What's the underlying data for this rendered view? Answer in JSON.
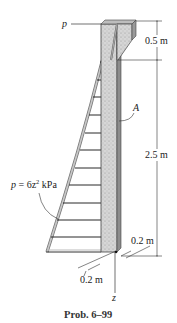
{
  "figure": {
    "caption": "Prob. 6–99",
    "labels": {
      "pressure_symbol": "p",
      "point_a": "A",
      "z_axis": "z",
      "load_equation_p": "p",
      "load_equation_eq": " = 6z",
      "load_equation_exp": "2",
      "load_equation_unit": " kPa"
    },
    "dimensions": {
      "top_height": "0.5 m",
      "main_height": "2.5 m",
      "wall_thickness": "0.2 m",
      "wall_width": "0.2 m"
    },
    "colors": {
      "wall_fill": "#d4d4d4",
      "wall_side": "#8a8a8a",
      "load_edge": "#a0a0a0",
      "line": "#222222"
    },
    "load_arrow_count": 10
  }
}
